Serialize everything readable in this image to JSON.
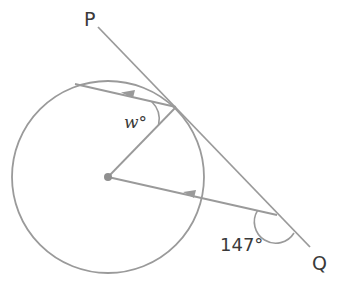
{
  "diagram": {
    "type": "circle-geometry",
    "colors": {
      "line": "#9a9a9a",
      "text": "#3a3a3a",
      "center_dot": "#8f8f8f"
    },
    "circle": {
      "cx": 108,
      "cy": 177,
      "r": 96
    },
    "points": {
      "P": {
        "label": "P",
        "x": 98,
        "y": 27
      },
      "Q": {
        "label": "Q",
        "x": 310,
        "y": 247
      },
      "T": {
        "x": 176,
        "y": 107
      },
      "A": {
        "x": 75,
        "y": 84
      },
      "O": {
        "x": 108,
        "y": 177
      },
      "B": {
        "x": 277,
        "y": 215
      }
    },
    "segments": [
      {
        "name": "tangent-PQ",
        "from": "P",
        "to": "Q"
      },
      {
        "name": "chord-TA",
        "from": "T",
        "to": "A",
        "arrow": "left"
      },
      {
        "name": "radius-OT",
        "from": "O",
        "to": "T"
      },
      {
        "name": "line-BO",
        "from": "B",
        "to": "O",
        "arrow": "left"
      }
    ],
    "labels": {
      "P": "P",
      "Q": "Q",
      "angle_w": "w°",
      "angle_147": "147°"
    },
    "angles": [
      {
        "name": "w",
        "vertex": "T",
        "label": "w°",
        "between": [
          "chord-TA",
          "radius-OT"
        ]
      },
      {
        "name": "147",
        "vertex": "B",
        "label": "147°",
        "value": 147,
        "between": [
          "line-BO",
          "tangent-PQ towards Q"
        ]
      }
    ]
  }
}
